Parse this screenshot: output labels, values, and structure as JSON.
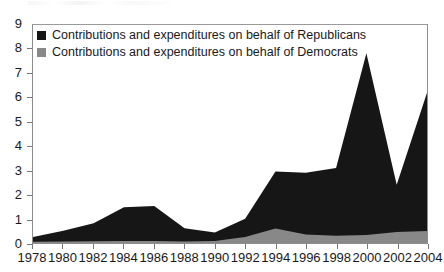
{
  "chart_data": {
    "type": "area",
    "stacked": true,
    "title": "",
    "subtitle": "",
    "xlabel": "",
    "ylabel": "",
    "xlim": [
      1978,
      2004
    ],
    "ylim": [
      0,
      9
    ],
    "grid": false,
    "legend_position": "top-left",
    "x": [
      1978,
      1980,
      1982,
      1984,
      1986,
      1988,
      1990,
      1992,
      1994,
      1996,
      1998,
      2000,
      2002,
      2004
    ],
    "xtick_labels": [
      "1978",
      "1980",
      "1982",
      "1984",
      "1986",
      "1988",
      "1990",
      "1992",
      "1994",
      "1996",
      "1998",
      "2000",
      "2002",
      "2004"
    ],
    "ytick_labels": [
      "0",
      "1",
      "2",
      "3",
      "4",
      "5",
      "6",
      "7",
      "8",
      "9"
    ],
    "ytick_values": [
      0,
      1,
      2,
      3,
      4,
      5,
      6,
      7,
      8,
      9
    ],
    "series": [
      {
        "name": "Contributions and expenditures on behalf of Democrats",
        "color": "#888889",
        "values": [
          0.05,
          0.06,
          0.07,
          0.08,
          0.08,
          0.06,
          0.08,
          0.25,
          0.6,
          0.35,
          0.3,
          0.33,
          0.45,
          0.5
        ]
      },
      {
        "name": "Contributions and expenditures on behalf of Republicans",
        "color": "#161616",
        "values": [
          0.2,
          0.45,
          0.75,
          1.4,
          1.45,
          0.55,
          0.35,
          0.75,
          2.35,
          2.55,
          2.8,
          7.5,
          1.95,
          5.7
        ]
      }
    ],
    "totals": [
      0.25,
      0.51,
      0.82,
      1.48,
      1.53,
      0.61,
      0.43,
      1.0,
      2.95,
      2.9,
      3.1,
      7.83,
      2.4,
      6.2
    ]
  },
  "legend": {
    "items": [
      {
        "label": "Contributions and expenditures on behalf of Republicans",
        "color": "#161616"
      },
      {
        "label": "Contributions and expenditures on behalf of Democrats",
        "color": "#888889"
      }
    ]
  },
  "colors": {
    "republican": "#161616",
    "democrat": "#888889",
    "axis": "#77777a",
    "frame": "#8d8d8d",
    "text": "#19191c",
    "background": "#ffffff"
  }
}
